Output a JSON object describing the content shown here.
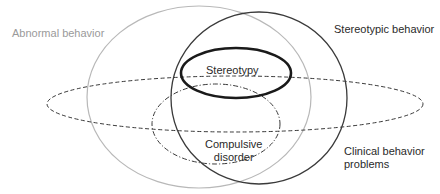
{
  "diagram": {
    "type": "venn",
    "sets": [
      {
        "id": "abnormal",
        "label": "Abnormal behavior",
        "stroke": "#b5b5b5",
        "style": "solid-thin"
      },
      {
        "id": "stereotypic",
        "label": "Stereotypic behavior",
        "stroke": "#3a3a3a",
        "style": "solid"
      },
      {
        "id": "stereotypy",
        "label": "Stereotypy",
        "stroke": "#1a1a1a",
        "style": "solid-bold"
      },
      {
        "id": "clinical",
        "label_lines": [
          "Clinical behavior",
          "problems"
        ],
        "stroke": "#3a3a3a",
        "style": "dashed"
      },
      {
        "id": "compulsive",
        "label_lines": [
          "Compulsive",
          "disorder"
        ],
        "stroke": "#3a3a3a",
        "style": "dash-dot"
      }
    ]
  }
}
